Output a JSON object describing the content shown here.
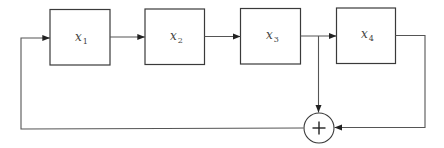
{
  "diagram": {
    "type": "shift-register-feedback",
    "blocks": [
      {
        "id": "x1",
        "var": "x",
        "sub": "1"
      },
      {
        "id": "x2",
        "var": "x",
        "sub": "2"
      },
      {
        "id": "x3",
        "var": "x",
        "sub": "3"
      },
      {
        "id": "x4",
        "var": "x",
        "sub": "4"
      }
    ],
    "adder": {
      "symbol": "+"
    },
    "connections": [
      "x1 -> x2",
      "x2 -> x3",
      "x3 -> x4",
      "x3 -> adder",
      "x4 -> adder",
      "adder -> x1"
    ]
  }
}
